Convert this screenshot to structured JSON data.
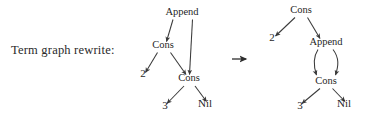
{
  "caption": {
    "text": "Term graph rewrite:"
  },
  "rewrite_arrow": {
    "symbol": "→"
  },
  "left_graph": {
    "name": "redex-term-graph",
    "nodes": [
      {
        "id": "append",
        "label": "Append",
        "x": 182,
        "y": 15
      },
      {
        "id": "cons1",
        "label": "Cons",
        "x": 163,
        "y": 48
      },
      {
        "id": "two",
        "label": "2",
        "x": 143,
        "y": 77
      },
      {
        "id": "cons2",
        "label": "Cons",
        "x": 189,
        "y": 81
      },
      {
        "id": "three",
        "label": "3",
        "x": 165,
        "y": 109
      },
      {
        "id": "nil",
        "label": "Nil",
        "x": 205,
        "y": 107
      }
    ],
    "edges": [
      {
        "from": "append",
        "to": "cons1"
      },
      {
        "from": "append",
        "to": "cons2"
      },
      {
        "from": "cons1",
        "to": "two"
      },
      {
        "from": "cons1",
        "to": "cons2"
      },
      {
        "from": "cons2",
        "to": "three"
      },
      {
        "from": "cons2",
        "to": "nil"
      }
    ]
  },
  "right_graph": {
    "name": "contractum-term-graph",
    "nodes": [
      {
        "id": "cons-top",
        "label": "Cons",
        "x": 301,
        "y": 13
      },
      {
        "id": "two",
        "label": "2",
        "x": 272,
        "y": 41
      },
      {
        "id": "append",
        "label": "Append",
        "x": 326,
        "y": 45
      },
      {
        "id": "cons-low",
        "label": "Cons",
        "x": 326,
        "y": 84
      },
      {
        "id": "three",
        "label": "3",
        "x": 300,
        "y": 109
      },
      {
        "id": "nil",
        "label": "Nil",
        "x": 344,
        "y": 107
      }
    ],
    "edges": [
      {
        "from": "cons-top",
        "to": "two"
      },
      {
        "from": "cons-top",
        "to": "append"
      },
      {
        "from": "append",
        "to": "cons-low",
        "style": "curved-left"
      },
      {
        "from": "append",
        "to": "cons-low",
        "style": "curved-right"
      },
      {
        "from": "cons-low",
        "to": "three"
      },
      {
        "from": "cons-low",
        "to": "nil"
      }
    ]
  },
  "colors": {
    "ink": "#1f1f1f",
    "edge": "#3a3a3a",
    "background": "#ffffff"
  }
}
